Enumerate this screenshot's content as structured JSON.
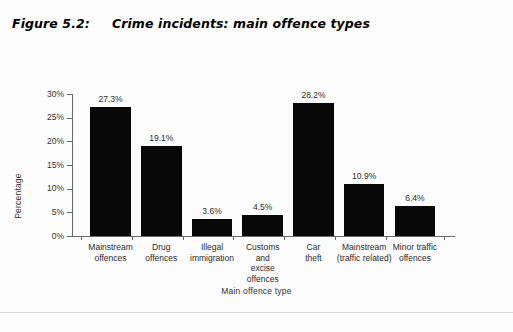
{
  "figure": {
    "number": "Figure 5.2:",
    "title": "Crime incidents: main offence types"
  },
  "chart_data": {
    "type": "bar",
    "title": "Crime incidents: main offence types",
    "xlabel": "Main offence type",
    "ylabel": "Percentage",
    "ylim": [
      0,
      30
    ],
    "grid": false,
    "legend": "none",
    "ytick_labels": [
      "0%",
      "5%",
      "10%",
      "15%",
      "20%",
      "25%",
      "30%"
    ],
    "ytick_values": [
      0,
      5,
      10,
      15,
      20,
      25,
      30
    ],
    "categories": [
      "Mainstream\noffences",
      "Drug\noffences",
      "Illegal\nimmigration",
      "Customs\nand\nexcise\noffences",
      "Car\ntheft",
      "Mainstream\n(traffic related)",
      "Minor traffic\noffences"
    ],
    "values": [
      27.3,
      19.1,
      3.6,
      4.5,
      28.2,
      10.9,
      6.4
    ],
    "data_labels": [
      "27.3%",
      "19.1%",
      "3.6%",
      "4.5%",
      "28.2%",
      "10.9%",
      "6.4%"
    ],
    "bar_color": "#080808",
    "axis_color": "#6a6a6a"
  }
}
